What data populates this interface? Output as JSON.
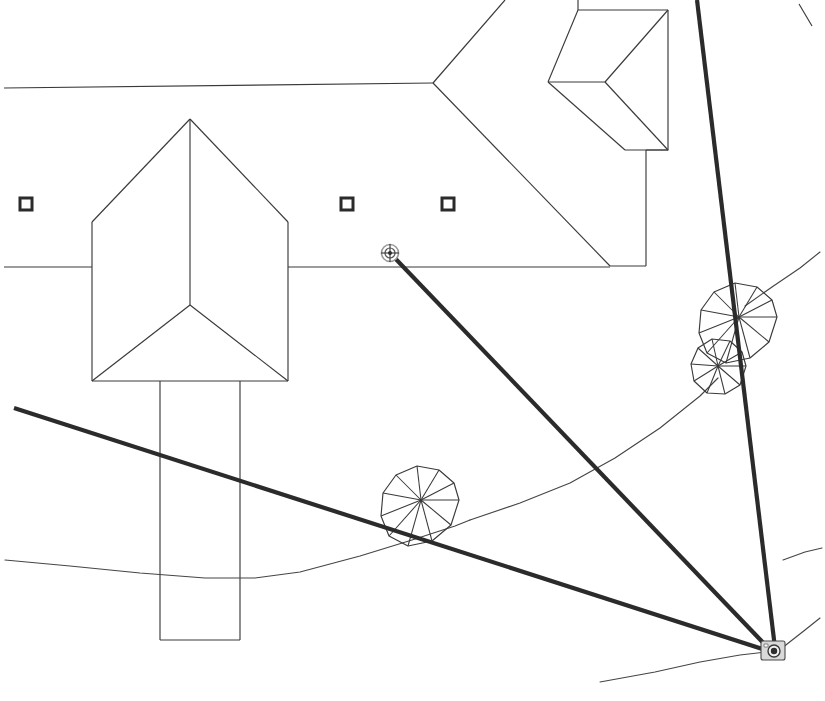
{
  "document": {
    "kind": "cad-site-plan",
    "title": "Site Plan — Camera Viewpoint",
    "background_color": "#ffffff",
    "line_color": "#3a3a3a",
    "accent_color": "#2b2b2b",
    "width": 825,
    "height": 701
  },
  "markers": {
    "camera": {
      "name": "camera-viewpoint-marker",
      "x": 772,
      "y": 652,
      "icon": "camera-icon",
      "label": ""
    },
    "target_node": {
      "name": "sight-line-target-node",
      "x": 390,
      "y": 253,
      "icon": "node-handle-icon",
      "label": ""
    },
    "survey_points": [
      {
        "name": "survey-point-1",
        "x": 26,
        "y": 204
      },
      {
        "name": "survey-point-2",
        "x": 347,
        "y": 204
      },
      {
        "name": "survey-point-3",
        "x": 448,
        "y": 204
      }
    ]
  },
  "sight_lines": [
    {
      "name": "sight-line-to-node",
      "x1": 772,
      "y1": 652,
      "x2": 391,
      "y2": 254
    },
    {
      "name": "sight-line-to-left-edge",
      "x1": 772,
      "y1": 652,
      "x2": 14,
      "y2": 408
    },
    {
      "name": "sight-line-vertical",
      "x1": 697,
      "y1": 0,
      "x2": 775,
      "y2": 648
    }
  ],
  "trees": [
    {
      "name": "tree-symbol-large-upper",
      "cx": 739,
      "cy": 317,
      "r": 38,
      "spokes": 13
    },
    {
      "name": "tree-symbol-small-lower",
      "cx": 718,
      "cy": 366,
      "r": 28,
      "spokes": 12
    },
    {
      "name": "tree-symbol-center",
      "cx": 421,
      "cy": 500,
      "r": 38,
      "spokes": 13
    }
  ],
  "structures": {
    "main_house": {
      "name": "main-house-hip-roof",
      "apex_x": 190,
      "apex_y": 119,
      "left_x": 92,
      "right_x": 288,
      "eave_y": 222,
      "base_y": 381,
      "ridge_end_y": 305
    },
    "wing_rectangle": {
      "name": "house-wing-rectangle",
      "x": 160,
      "y": 381,
      "width": 80,
      "height": 259
    },
    "upper_right_roof": {
      "name": "upper-right-hip-roof",
      "label": ""
    },
    "dormer": {
      "name": "dormer-roof",
      "label": ""
    }
  },
  "contours": [
    {
      "name": "contour-line-lower",
      "label": ""
    },
    {
      "name": "contour-line-right",
      "label": ""
    },
    {
      "name": "contour-line-bottom-right",
      "label": ""
    }
  ],
  "boundary_lines": [
    {
      "name": "property-line-top",
      "label": ""
    },
    {
      "name": "property-line-mid",
      "label": ""
    },
    {
      "name": "property-line-right",
      "label": ""
    }
  ]
}
